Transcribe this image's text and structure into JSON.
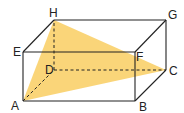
{
  "figure": {
    "type": "rectangular cuboid with shaded triangle",
    "vertices": {
      "A": {
        "label": "A",
        "x": 23,
        "y": 101
      },
      "B": {
        "label": "B",
        "x": 135,
        "y": 101
      },
      "C": {
        "label": "C",
        "x": 166,
        "y": 70
      },
      "D": {
        "label": "D",
        "x": 54,
        "y": 70
      },
      "E": {
        "label": "E",
        "x": 23,
        "y": 52
      },
      "F": {
        "label": "F",
        "x": 135,
        "y": 52
      },
      "G": {
        "label": "G",
        "x": 166,
        "y": 20
      },
      "H": {
        "label": "H",
        "x": 54,
        "y": 20
      }
    },
    "shaded_triangle": [
      "A",
      "H",
      "C"
    ],
    "hidden_edges": [
      "AD",
      "DC",
      "DH"
    ],
    "colors": {
      "fill": "#F9D06A",
      "edge": "#222222",
      "background": "#FFFFFF"
    }
  }
}
